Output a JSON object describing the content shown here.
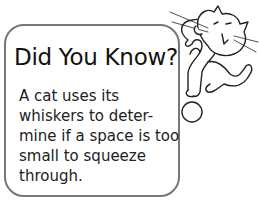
{
  "sidebar_box": {
    "title": "Did You Know?",
    "lines": [
      "A cat uses its",
      "whiskers to deter-",
      "mine if a space is too",
      "small to squeeze",
      "through."
    ]
  },
  "illustration": {
    "icon": "cat-question-mark-icon"
  }
}
